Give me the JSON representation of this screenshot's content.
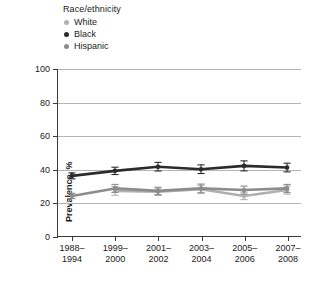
{
  "chart_data": {
    "type": "line",
    "title": "",
    "xlabel": "",
    "ylabel": "Prevalence, %",
    "ylim": [
      0,
      100
    ],
    "yticks": [
      0,
      20,
      40,
      60,
      80,
      100
    ],
    "grid": true,
    "legend_position": "top-left",
    "legend_title": "Race/ethnicity",
    "categories": [
      "1988–1994",
      "1999–2000",
      "2001–2002",
      "2003–2004",
      "2005–2006",
      "2007–2008"
    ],
    "series": [
      {
        "name": "White",
        "color": "#b0b0b0",
        "values": [
          null,
          27.0,
          26.5,
          28.0,
          24.0,
          27.5
        ],
        "err_low": [
          null,
          2.6,
          2.2,
          2.4,
          2.2,
          2.4
        ],
        "err_high": [
          null,
          2.6,
          2.2,
          2.4,
          2.2,
          2.4
        ]
      },
      {
        "name": "Black",
        "color": "#2b2b2b",
        "values": [
          36.0,
          39.0,
          41.5,
          40.0,
          42.0,
          41.0
        ],
        "err_low": [
          1.8,
          2.2,
          2.6,
          2.6,
          3.0,
          2.6
        ],
        "err_high": [
          1.8,
          2.2,
          2.6,
          2.6,
          3.0,
          2.6
        ]
      },
      {
        "name": "Hispanic",
        "color": "#8c8c8c",
        "values": [
          24.0,
          28.5,
          27.0,
          28.5,
          27.5,
          28.5
        ],
        "err_low": [
          1.6,
          2.4,
          2.2,
          2.6,
          2.4,
          2.4
        ],
        "err_high": [
          1.6,
          2.4,
          2.2,
          2.6,
          2.4,
          2.4
        ]
      }
    ]
  },
  "legend": {
    "title": "Race/ethnicity",
    "items": [
      {
        "label": "White",
        "color": "#b0b0b0"
      },
      {
        "label": "Black",
        "color": "#2b2b2b"
      },
      {
        "label": "Hispanic",
        "color": "#8c8c8c"
      }
    ]
  },
  "axes": {
    "y_title": "Prevalence, %",
    "y_ticks": [
      "0",
      "20",
      "40",
      "60",
      "80",
      "100"
    ],
    "x_ticks": [
      {
        "line1": "1988–",
        "line2": "1994"
      },
      {
        "line1": "1999–",
        "line2": "2000"
      },
      {
        "line1": "2001–",
        "line2": "2002"
      },
      {
        "line1": "2003–",
        "line2": "2004"
      },
      {
        "line1": "2005–",
        "line2": "2006"
      },
      {
        "line1": "2007–",
        "line2": "2008"
      }
    ]
  },
  "colors": {
    "axis": "#3a3a3a",
    "grid": "#b4b4b4",
    "background": "#ffffff"
  }
}
